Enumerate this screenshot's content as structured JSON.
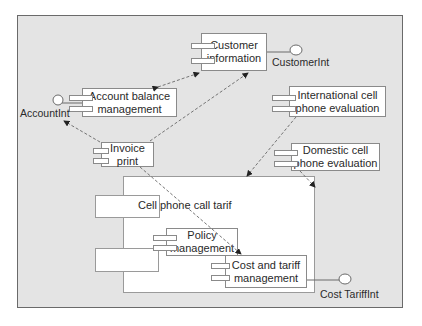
{
  "diagram": {
    "type": "UML component diagram",
    "components": {
      "customer_information": "Customer\ninformation",
      "account_balance": "Account balance\nmanagement",
      "international_eval": "International cell\nphone evaluation",
      "domestic_eval": "Domestic cell\nphone evaluation",
      "invoice_print": "Invoice\nprint",
      "cell_phone_call_tarif": "Cell phone call tarif",
      "policy_management": "Policy\nmanagement",
      "cost_tariff_management": "Cost and tariff\nmanagement"
    },
    "interfaces": {
      "customer": "CustomerInt",
      "account": "AccountInt",
      "cost_tariff": "Cost TariffInt"
    },
    "dependencies": [
      {
        "from": "Account balance management",
        "to": "Customer information",
        "bidirectional": true
      },
      {
        "from": "Invoice print",
        "to": "Customer information"
      },
      {
        "from": "Invoice print",
        "to": "AccountInt"
      },
      {
        "from": "Invoice print",
        "to": "Cost and tariff management"
      },
      {
        "from": "International cell phone evaluation",
        "to": "Cell phone call tarif"
      },
      {
        "from": "Domestic cell phone evaluation",
        "to": "Cell phone call tarif"
      }
    ],
    "colors": {
      "background": "#e4e4e4",
      "box_fill": "#ffffff",
      "box_border": "#8a8a8a",
      "arrow": "#555555"
    }
  }
}
